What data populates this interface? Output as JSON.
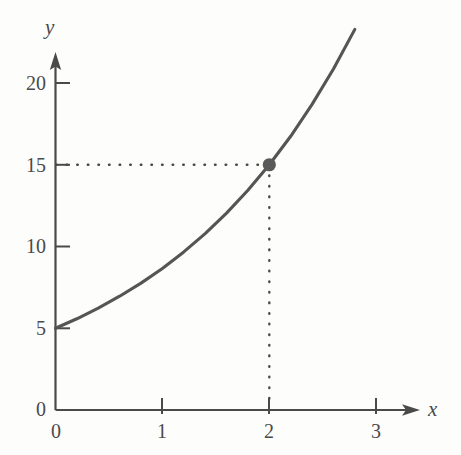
{
  "figure": {
    "background_color": "#fdfdfc",
    "ink_color": "#4a4a4a",
    "curve_color": "#555555",
    "point_color": "#5a5a5a",
    "guide_color": "#4a4a4a"
  },
  "axes": {
    "x_name": "x",
    "y_name": "y",
    "x_arrow_name": "x-axis-arrow",
    "y_arrow_name": "y-axis-arrow"
  },
  "chart_data": {
    "type": "line",
    "title": "",
    "subtitle": "",
    "xlabel": "x",
    "ylabel": "y",
    "xlim": [
      0,
      3.35
    ],
    "ylim": [
      0,
      22.8
    ],
    "xticks": [
      0,
      1,
      2,
      3
    ],
    "xtick_labels": [
      "0",
      "1",
      "2",
      "3"
    ],
    "yticks": [
      0,
      5,
      10,
      15,
      20
    ],
    "ytick_labels": [
      "0",
      "5",
      "10",
      "15",
      "20"
    ],
    "grid": false,
    "legend": null,
    "series": [
      {
        "name": "exponential-curve",
        "equation": "y = 5 * 3^(x/2)",
        "x": [
          0,
          0.2,
          0.4,
          0.6,
          0.8,
          1.0,
          1.2,
          1.4,
          1.6,
          1.8,
          2.0,
          2.2,
          2.4,
          2.6,
          2.8
        ],
        "y": [
          5.0,
          5.58,
          6.23,
          6.96,
          7.76,
          8.66,
          9.67,
          10.79,
          12.04,
          13.44,
          15.0,
          16.74,
          18.69,
          20.86,
          23.28
        ]
      }
    ],
    "annotations": [
      {
        "name": "marked-point",
        "x": 2,
        "y": 15,
        "marker": "filled-circle",
        "guides": [
          "horizontal-dotted-to-y-axis",
          "vertical-dotted-to-x-axis"
        ]
      }
    ]
  },
  "labels": {
    "y_ticks": [
      {
        "text": "20",
        "value": 20
      },
      {
        "text": "15",
        "value": 15
      },
      {
        "text": "10",
        "value": 10
      },
      {
        "text": "5",
        "value": 5
      },
      {
        "text": "0",
        "value": 0
      }
    ],
    "x_ticks": [
      {
        "text": "0",
        "value": 0
      },
      {
        "text": "1",
        "value": 1
      },
      {
        "text": "2",
        "value": 2
      },
      {
        "text": "3",
        "value": 3
      }
    ]
  }
}
